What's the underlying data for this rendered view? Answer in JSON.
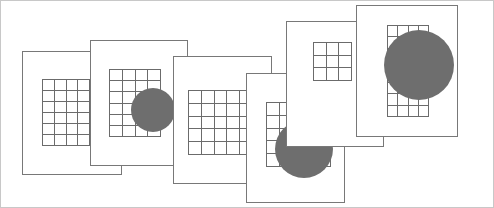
{
  "figure": {
    "width": 494,
    "height": 208,
    "background_color": "#ffffff",
    "outer_border_color": "#c8c8c8",
    "card_fill_color": "#ffffff",
    "card_border_color": "#787878",
    "grid_line_color": "#6b6b6b",
    "disc_color": "#6e6e6e",
    "card_count": 6,
    "disc_count": 4
  },
  "cards": [
    {
      "id": "card-1",
      "label": "Card 1",
      "x": 21,
      "y": 50,
      "width": 100,
      "height": 124,
      "z": 1,
      "grid": {
        "x": 19,
        "y": 27,
        "width": 48,
        "height": 67,
        "cols": 4,
        "rows": 6
      },
      "disc": null
    },
    {
      "id": "card-2",
      "label": "Card 2",
      "x": 89,
      "y": 39,
      "width": 98,
      "height": 126,
      "z": 2,
      "grid": {
        "x": 18,
        "y": 28,
        "width": 52,
        "height": 68,
        "cols": 4,
        "rows": 6
      },
      "disc": {
        "cx": 62,
        "cy": 69,
        "r": 22
      }
    },
    {
      "id": "card-3",
      "label": "Card 3",
      "x": 172,
      "y": 55,
      "width": 99,
      "height": 128,
      "z": 3,
      "grid": {
        "x": 14,
        "y": 33,
        "width": 65,
        "height": 65,
        "cols": 5,
        "rows": 5
      },
      "disc": null
    },
    {
      "id": "card-4",
      "label": "Card 4",
      "x": 245,
      "y": 72,
      "width": 99,
      "height": 130,
      "z": 4,
      "grid": {
        "x": 19,
        "y": 28,
        "width": 65,
        "height": 65,
        "cols": 5,
        "rows": 5
      },
      "disc": {
        "cx": 57,
        "cy": 75,
        "r": 29
      }
    },
    {
      "id": "card-5",
      "label": "Card 5",
      "x": 285,
      "y": 20,
      "width": 98,
      "height": 126,
      "z": 5,
      "grid": {
        "x": 26,
        "y": 20,
        "width": 39,
        "height": 39,
        "cols": 3,
        "rows": 3
      },
      "disc": {
        "cx": 99,
        "cy": 56,
        "r": 22
      }
    },
    {
      "id": "card-6",
      "label": "Card 6",
      "x": 355,
      "y": 4,
      "width": 102,
      "height": 132,
      "z": 6,
      "grid": {
        "x": 30,
        "y": 19,
        "width": 42,
        "height": 92,
        "cols": 4,
        "rows": 8
      },
      "disc": {
        "cx": 62,
        "cy": 59,
        "r": 35
      }
    }
  ]
}
